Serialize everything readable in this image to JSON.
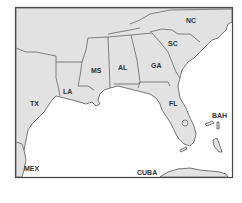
{
  "map": {
    "colors": {
      "land": "#e2e2e2",
      "water": "#ffffff",
      "border": "#555555",
      "text": "#333333"
    },
    "labels": {
      "nc": "NC",
      "sc": "SC",
      "ga": "GA",
      "al": "AL",
      "ms": "MS",
      "la": "LA",
      "tx": "TX",
      "fl": "FL",
      "bah": "BAH",
      "mex": "MEX",
      "cuba": "CUBA"
    }
  }
}
